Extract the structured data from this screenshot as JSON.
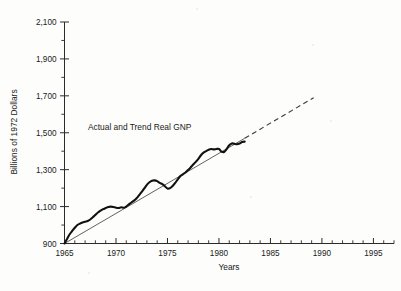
{
  "chart_data": {
    "type": "line",
    "title": "",
    "xlabel": "Years",
    "ylabel": "Billions of 1972 Dollars",
    "annotation": "Actual and Trend Real GNP",
    "xlim": [
      1965,
      1997
    ],
    "ylim": [
      900,
      2100
    ],
    "grid": false,
    "legend_position": "none",
    "x_tick_labels": [
      "1965",
      "1970",
      "1975",
      "1980",
      "1985",
      "1990",
      "1995"
    ],
    "x_ticks": [
      1965,
      1970,
      1975,
      1980,
      1985,
      1990,
      1995
    ],
    "x_minor_tick_step": 1,
    "y_tick_labels": [
      "900",
      "1,100",
      "1,300",
      "1,500",
      "1,700",
      "1,900",
      "2,100"
    ],
    "y_ticks": [
      900,
      1100,
      1300,
      1500,
      1700,
      1900,
      2100
    ],
    "y_minor_tick_step": 100,
    "series": [
      {
        "name": "Actual Real GNP",
        "style": "solid-thick",
        "x": [
          1965.0,
          1965.25,
          1965.5,
          1965.75,
          1966.0,
          1966.25,
          1966.5,
          1966.75,
          1967.0,
          1967.25,
          1967.5,
          1967.75,
          1968.0,
          1968.25,
          1968.5,
          1968.75,
          1969.0,
          1969.25,
          1969.5,
          1969.75,
          1970.0,
          1970.25,
          1970.5,
          1970.75,
          1971.0,
          1971.25,
          1971.5,
          1971.75,
          1972.0,
          1972.25,
          1972.5,
          1972.75,
          1973.0,
          1973.25,
          1973.5,
          1973.75,
          1974.0,
          1974.25,
          1974.5,
          1974.75,
          1975.0,
          1975.25,
          1975.5,
          1975.75,
          1976.0,
          1976.25,
          1976.5,
          1976.75,
          1977.0,
          1977.25,
          1977.5,
          1977.75,
          1978.0,
          1978.25,
          1978.5,
          1978.75,
          1979.0,
          1979.25,
          1979.5,
          1979.75,
          1980.0,
          1980.25,
          1980.5,
          1980.75,
          1981.0,
          1981.25,
          1981.5,
          1981.75,
          1982.0,
          1982.25,
          1982.5
        ],
        "y": [
          900,
          925,
          950,
          968,
          985,
          1000,
          1008,
          1014,
          1018,
          1022,
          1030,
          1042,
          1055,
          1068,
          1078,
          1086,
          1092,
          1098,
          1100,
          1098,
          1094,
          1092,
          1096,
          1094,
          1100,
          1112,
          1122,
          1132,
          1145,
          1162,
          1180,
          1198,
          1218,
          1232,
          1240,
          1242,
          1238,
          1228,
          1222,
          1210,
          1198,
          1200,
          1212,
          1228,
          1248,
          1265,
          1275,
          1285,
          1298,
          1312,
          1328,
          1342,
          1358,
          1378,
          1392,
          1400,
          1408,
          1412,
          1410,
          1412,
          1412,
          1398,
          1396,
          1412,
          1432,
          1442,
          1440,
          1438,
          1442,
          1450,
          1452
        ]
      },
      {
        "name": "Trend Real GNP",
        "style": "solid-thin",
        "x": [
          1965.0,
          1982.5
        ],
        "y": [
          900,
          1470
        ]
      },
      {
        "name": "Trend Real GNP (projected)",
        "style": "dashed",
        "x": [
          1982.5,
          1989.2
        ],
        "y": [
          1470,
          1690
        ]
      }
    ]
  },
  "axis": {
    "y_title": "Billions of 1972 Dollars",
    "x_title": "Years"
  }
}
